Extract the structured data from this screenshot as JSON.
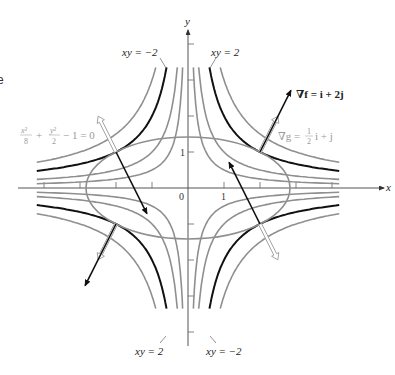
{
  "figure": {
    "edge_glyph": "e",
    "axes": {
      "x_label": "x",
      "y_label": "y",
      "origin_label": "0",
      "x_tick_label": "1",
      "y_tick_label": "1",
      "origin_px": [
        188,
        188
      ],
      "unit_px": 36,
      "x_range": [
        -4.7,
        5.5
      ],
      "y_range": [
        -4.3,
        4.5
      ]
    },
    "labels": {
      "hyperbola_top_left": "xy = −2",
      "hyperbola_top_right": "xy = 2",
      "hyperbola_bottom_left": "xy = 2",
      "hyperbola_bottom_right": "xy = −2",
      "grad_f": "∇f = i + 2j",
      "grad_g_prefix": "∇g = ",
      "grad_g_num": "1",
      "grad_g_den": "2",
      "grad_g_suffix": "i + j",
      "constraint_x_num": "x²",
      "constraint_x_den": "8",
      "constraint_plus": "+",
      "constraint_y_num": "y²",
      "constraint_y_den": "2",
      "constraint_rest": "− 1 = 0"
    },
    "curves": {
      "constraint": "x^2/8 + y^2/2 = 1",
      "level_values_gray": [
        0.5,
        1,
        3
      ],
      "level_value_black": 2,
      "tangency_points": [
        [
          2,
          1
        ],
        [
          -2,
          1
        ],
        [
          -2,
          -1
        ],
        [
          2,
          -1
        ]
      ]
    },
    "colors": {
      "black_curve": "#111111",
      "gray_curve": "#8f8f8f",
      "axis": "#444444",
      "gray_text": "#9a9a9a"
    }
  }
}
